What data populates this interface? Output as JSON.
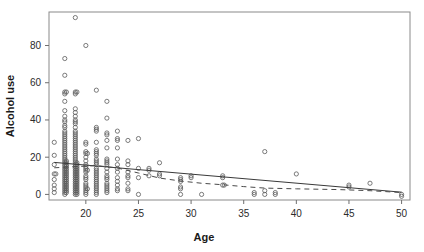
{
  "chart_data": {
    "type": "scatter",
    "title": "",
    "xlabel": "Age",
    "ylabel": "Alcohol use",
    "xlim": [
      16.5,
      50.8
    ],
    "ylim": [
      -3,
      98
    ],
    "grid": false,
    "legend": "none",
    "xticks": [
      20,
      25,
      30,
      35,
      40,
      45,
      50
    ],
    "yticks": [
      0,
      20,
      40,
      60,
      80
    ],
    "xtick_labels": [
      "20",
      "25",
      "30",
      "35",
      "40",
      "45",
      "50"
    ],
    "ytick_labels": [
      "0",
      "20",
      "40",
      "60",
      "80"
    ],
    "marker": "open-circle",
    "series": [
      {
        "name": "observations",
        "points": [
          [
            17,
            28
          ],
          [
            17,
            21
          ],
          [
            17,
            16
          ],
          [
            17,
            11
          ],
          [
            17,
            11
          ],
          [
            17,
            8
          ],
          [
            17,
            5
          ],
          [
            17,
            3
          ],
          [
            17,
            1
          ],
          [
            18,
            73
          ],
          [
            18,
            64
          ],
          [
            18,
            55
          ],
          [
            18,
            55
          ],
          [
            18,
            54
          ],
          [
            18,
            50
          ],
          [
            18,
            45
          ],
          [
            18,
            42
          ],
          [
            18,
            40
          ],
          [
            18,
            39
          ],
          [
            18,
            37
          ],
          [
            18,
            36
          ],
          [
            18,
            34
          ],
          [
            18,
            33
          ],
          [
            18,
            32
          ],
          [
            18,
            31
          ],
          [
            18,
            30
          ],
          [
            18,
            29
          ],
          [
            18,
            28
          ],
          [
            18,
            27
          ],
          [
            18,
            26
          ],
          [
            18,
            25
          ],
          [
            18,
            24
          ],
          [
            18,
            23
          ],
          [
            18,
            22
          ],
          [
            18,
            21
          ],
          [
            18,
            20
          ],
          [
            18,
            19
          ],
          [
            18,
            18
          ],
          [
            18,
            18
          ],
          [
            18,
            17
          ],
          [
            18,
            17
          ],
          [
            18,
            16
          ],
          [
            18,
            16
          ],
          [
            18,
            15
          ],
          [
            18,
            15
          ],
          [
            18,
            14
          ],
          [
            18,
            14
          ],
          [
            18,
            13
          ],
          [
            18,
            13
          ],
          [
            18,
            12
          ],
          [
            18,
            12
          ],
          [
            18,
            11
          ],
          [
            18,
            11
          ],
          [
            18,
            10
          ],
          [
            18,
            10
          ],
          [
            18,
            9
          ],
          [
            18,
            9
          ],
          [
            18,
            8
          ],
          [
            18,
            8
          ],
          [
            18,
            7
          ],
          [
            18,
            7
          ],
          [
            18,
            6
          ],
          [
            18,
            6
          ],
          [
            18,
            5
          ],
          [
            18,
            5
          ],
          [
            18,
            4
          ],
          [
            18,
            4
          ],
          [
            18,
            3
          ],
          [
            18,
            3
          ],
          [
            18,
            2
          ],
          [
            18,
            2
          ],
          [
            18,
            1
          ],
          [
            18,
            1
          ],
          [
            18,
            0
          ],
          [
            19,
            95
          ],
          [
            19,
            55
          ],
          [
            19,
            55
          ],
          [
            19,
            54
          ],
          [
            19,
            46
          ],
          [
            19,
            44
          ],
          [
            19,
            42
          ],
          [
            19,
            40
          ],
          [
            19,
            39
          ],
          [
            19,
            38
          ],
          [
            19,
            36
          ],
          [
            19,
            34
          ],
          [
            19,
            33
          ],
          [
            19,
            32
          ],
          [
            19,
            31
          ],
          [
            19,
            30
          ],
          [
            19,
            29
          ],
          [
            19,
            28
          ],
          [
            19,
            27
          ],
          [
            19,
            26
          ],
          [
            19,
            25
          ],
          [
            19,
            24
          ],
          [
            19,
            23
          ],
          [
            19,
            22
          ],
          [
            19,
            21
          ],
          [
            19,
            20
          ],
          [
            19,
            19
          ],
          [
            19,
            18
          ],
          [
            19,
            17
          ],
          [
            19,
            17
          ],
          [
            19,
            16
          ],
          [
            19,
            16
          ],
          [
            19,
            15
          ],
          [
            19,
            15
          ],
          [
            19,
            14
          ],
          [
            19,
            14
          ],
          [
            19,
            13
          ],
          [
            19,
            13
          ],
          [
            19,
            12
          ],
          [
            19,
            12
          ],
          [
            19,
            11
          ],
          [
            19,
            11
          ],
          [
            19,
            10
          ],
          [
            19,
            10
          ],
          [
            19,
            9
          ],
          [
            19,
            9
          ],
          [
            19,
            8
          ],
          [
            19,
            8
          ],
          [
            19,
            7
          ],
          [
            19,
            7
          ],
          [
            19,
            6
          ],
          [
            19,
            6
          ],
          [
            19,
            5
          ],
          [
            19,
            5
          ],
          [
            19,
            4
          ],
          [
            19,
            4
          ],
          [
            19,
            3
          ],
          [
            19,
            3
          ],
          [
            19,
            2
          ],
          [
            19,
            2
          ],
          [
            19,
            1
          ],
          [
            19,
            1
          ],
          [
            19,
            0
          ],
          [
            19,
            0
          ],
          [
            20,
            80
          ],
          [
            20,
            28
          ],
          [
            20,
            27
          ],
          [
            20,
            23
          ],
          [
            20,
            22
          ],
          [
            20,
            22
          ],
          [
            20,
            20
          ],
          [
            20,
            18
          ],
          [
            20,
            16
          ],
          [
            20,
            15
          ],
          [
            20,
            14
          ],
          [
            20,
            13
          ],
          [
            20,
            13
          ],
          [
            20,
            12
          ],
          [
            20,
            10
          ],
          [
            20,
            9
          ],
          [
            20,
            8
          ],
          [
            20,
            6
          ],
          [
            20,
            5
          ],
          [
            20,
            4
          ],
          [
            20,
            3
          ],
          [
            20,
            3
          ],
          [
            20,
            2
          ],
          [
            20,
            1
          ],
          [
            20,
            0
          ],
          [
            21,
            56
          ],
          [
            21,
            36
          ],
          [
            21,
            35
          ],
          [
            21,
            34
          ],
          [
            21,
            28
          ],
          [
            21,
            24
          ],
          [
            21,
            23
          ],
          [
            21,
            22
          ],
          [
            21,
            21
          ],
          [
            21,
            19
          ],
          [
            21,
            18
          ],
          [
            21,
            17
          ],
          [
            21,
            16
          ],
          [
            21,
            14
          ],
          [
            21,
            13
          ],
          [
            21,
            12
          ],
          [
            21,
            11
          ],
          [
            21,
            10
          ],
          [
            21,
            9
          ],
          [
            21,
            8
          ],
          [
            21,
            7
          ],
          [
            21,
            6
          ],
          [
            21,
            5
          ],
          [
            21,
            4
          ],
          [
            21,
            3
          ],
          [
            21,
            2
          ],
          [
            21,
            1
          ],
          [
            21,
            0
          ],
          [
            22,
            50
          ],
          [
            22,
            41
          ],
          [
            22,
            33
          ],
          [
            22,
            32
          ],
          [
            22,
            29
          ],
          [
            22,
            25
          ],
          [
            22,
            19
          ],
          [
            22,
            18
          ],
          [
            22,
            17
          ],
          [
            22,
            16
          ],
          [
            22,
            14
          ],
          [
            22,
            12
          ],
          [
            22,
            10
          ],
          [
            22,
            9
          ],
          [
            22,
            8
          ],
          [
            22,
            6
          ],
          [
            22,
            5
          ],
          [
            22,
            4
          ],
          [
            22,
            3
          ],
          [
            22,
            2
          ],
          [
            22,
            1
          ],
          [
            23,
            34
          ],
          [
            23,
            30
          ],
          [
            23,
            29
          ],
          [
            23,
            25
          ],
          [
            23,
            19
          ],
          [
            23,
            16
          ],
          [
            23,
            14
          ],
          [
            23,
            12
          ],
          [
            23,
            9
          ],
          [
            23,
            7
          ],
          [
            23,
            5
          ],
          [
            23,
            3
          ],
          [
            23,
            2
          ],
          [
            24,
            29
          ],
          [
            24,
            18
          ],
          [
            24,
            16
          ],
          [
            24,
            12
          ],
          [
            24,
            10
          ],
          [
            24,
            9
          ],
          [
            24,
            6
          ],
          [
            24,
            3
          ],
          [
            24,
            2
          ],
          [
            25,
            30
          ],
          [
            25,
            14
          ],
          [
            25,
            9
          ],
          [
            25,
            0
          ],
          [
            26,
            14
          ],
          [
            26,
            13
          ],
          [
            26,
            10
          ],
          [
            27,
            17
          ],
          [
            27,
            11
          ],
          [
            27,
            10
          ],
          [
            29,
            9
          ],
          [
            29,
            8
          ],
          [
            29,
            7
          ],
          [
            29,
            4
          ],
          [
            29,
            3
          ],
          [
            29,
            0
          ],
          [
            30,
            10
          ],
          [
            30,
            9
          ],
          [
            31,
            0
          ],
          [
            33,
            10
          ],
          [
            33,
            9
          ],
          [
            33,
            5
          ],
          [
            33,
            5
          ],
          [
            36,
            1
          ],
          [
            36,
            0
          ],
          [
            37,
            23
          ],
          [
            37,
            2
          ],
          [
            37,
            0
          ],
          [
            38,
            1
          ],
          [
            38,
            0
          ],
          [
            40,
            11
          ],
          [
            45,
            5
          ],
          [
            45,
            4
          ],
          [
            47,
            6
          ],
          [
            50,
            0
          ],
          [
            50,
            -1
          ]
        ]
      }
    ],
    "fit_lines": [
      {
        "name": "linear-fit",
        "style": "solid",
        "points": [
          [
            17,
            17.2
          ],
          [
            50,
            1.2
          ]
        ]
      },
      {
        "name": "smoothed-fit",
        "style": "dashed",
        "points": [
          [
            17,
            14.3
          ],
          [
            19,
            14.9
          ],
          [
            21,
            15.5
          ],
          [
            23,
            14.2
          ],
          [
            25,
            11.5
          ],
          [
            27,
            8.8
          ],
          [
            29,
            7.2
          ],
          [
            31,
            6.0
          ],
          [
            33,
            5.2
          ],
          [
            35,
            4.2
          ],
          [
            37,
            3.4
          ],
          [
            40,
            3.0
          ],
          [
            44,
            2.6
          ],
          [
            47,
            2.0
          ],
          [
            50,
            1.0
          ]
        ]
      }
    ]
  }
}
